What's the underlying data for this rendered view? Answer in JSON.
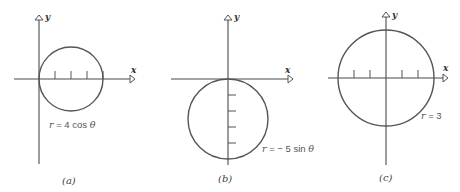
{
  "figure": {
    "panels": [
      {
        "id": "a",
        "caption": "(a)",
        "equation": {
          "var": "r",
          "rest": " = 4 cos ",
          "theta": "θ"
        },
        "axis_labels": {
          "x": "x",
          "y": "y"
        },
        "curve": {
          "type": "circle",
          "center_polar_eq": "r = 4 cos θ",
          "diameter_units": 4,
          "orientation": "right of origin, tangent to y-axis"
        },
        "ticks": {
          "axis": "x",
          "count": 4
        }
      },
      {
        "id": "b",
        "caption": "(b)",
        "equation": {
          "var": "r",
          "rest": " = − 5 sin ",
          "theta": "θ"
        },
        "axis_labels": {
          "x": "x",
          "y": "y"
        },
        "curve": {
          "type": "circle",
          "center_polar_eq": "r = −5 sin θ",
          "diameter_units": 5,
          "orientation": "below origin, tangent to x-axis"
        },
        "ticks": {
          "axis": "y",
          "count": 4
        }
      },
      {
        "id": "c",
        "caption": "(c)",
        "equation": {
          "var": "r",
          "rest": " = 3",
          "theta": ""
        },
        "axis_labels": {
          "x": "x",
          "y": "y"
        },
        "curve": {
          "type": "circle",
          "center_polar_eq": "r = 3",
          "radius_units": 3,
          "orientation": "centered at origin"
        },
        "ticks": {
          "axis": "x",
          "count": 4
        }
      }
    ]
  },
  "colors": {
    "axis": "#4a4a4a",
    "curve": "#555555",
    "background": "#ffffff"
  }
}
